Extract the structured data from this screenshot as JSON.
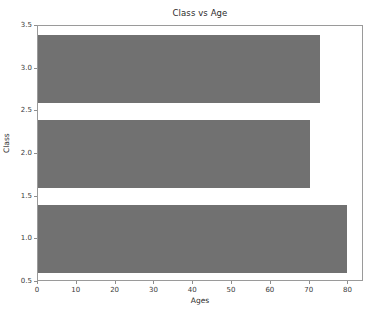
{
  "chart_data": {
    "type": "bar",
    "orientation": "horizontal",
    "title": "Class vs Age",
    "xlabel": "Ages",
    "ylabel": "Class",
    "categories": [
      "1",
      "2",
      "3"
    ],
    "values": [
      79.5,
      70.0,
      72.7
    ],
    "series": [
      {
        "name": "Ages",
        "values": [
          79.5,
          70.0,
          72.7
        ]
      }
    ],
    "xlim": [
      0,
      84
    ],
    "ylim": [
      0.5,
      3.5
    ],
    "xticks": [
      "0",
      "10",
      "20",
      "30",
      "40",
      "50",
      "60",
      "70",
      "80"
    ],
    "xtick_values": [
      0,
      10,
      20,
      30,
      40,
      50,
      60,
      70,
      80
    ],
    "yticks": [
      "0.5",
      "1.0",
      "1.5",
      "2.0",
      "2.5",
      "3.0",
      "3.5"
    ],
    "ytick_values": [
      0.5,
      1.0,
      1.5,
      2.0,
      2.5,
      3.0,
      3.5
    ],
    "grid": false,
    "legend": null,
    "bar_color": "#717171",
    "bar_height": 0.8,
    "background_color": "#ffffff",
    "axis_color": "#9a9a9a"
  }
}
